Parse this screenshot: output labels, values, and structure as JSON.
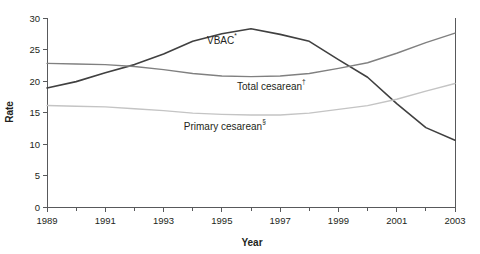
{
  "chart_data": {
    "type": "line",
    "title": "",
    "xlabel": "Year",
    "ylabel": "Rate",
    "xlim": [
      1989,
      2003
    ],
    "ylim": [
      0,
      30
    ],
    "ytick_step": 5,
    "grid": false,
    "legend_position": "inline-annotations",
    "x": [
      1989,
      1990,
      1991,
      1992,
      1993,
      1994,
      1995,
      1996,
      1997,
      1998,
      1999,
      2000,
      2001,
      2002,
      2003
    ],
    "xticks": [
      1989,
      1991,
      1993,
      1995,
      1997,
      1999,
      2001,
      2003
    ],
    "xtick_labels": [
      "1989",
      "1991",
      "1993",
      "1995",
      "1997",
      "1999",
      "2001",
      "2003"
    ],
    "yticks": [
      0,
      5,
      10,
      15,
      20,
      25,
      30
    ],
    "ytick_labels": [
      "0",
      "5",
      "10",
      "15",
      "20",
      "25",
      "30"
    ],
    "series": [
      {
        "name": "VBAC",
        "label_text": "VBAC",
        "label_sup": "*",
        "color": "#404040",
        "width": 1.6,
        "label_x": 1995.0,
        "label_y": 25.9,
        "values": [
          18.9,
          19.9,
          21.3,
          22.6,
          24.3,
          26.3,
          27.5,
          28.3,
          27.4,
          26.3,
          23.4,
          20.6,
          16.4,
          12.6,
          10.6
        ]
      },
      {
        "name": "Total cesarean",
        "label_text": "Total cesarean",
        "label_sup": "†",
        "color": "#808080",
        "width": 1.4,
        "label_x": 1996.7,
        "label_y": 18.6,
        "values": [
          22.8,
          22.7,
          22.6,
          22.3,
          21.8,
          21.2,
          20.8,
          20.7,
          20.8,
          21.2,
          22.0,
          22.9,
          24.4,
          26.1,
          27.6
        ]
      },
      {
        "name": "Primary cesarean",
        "label_text": "Primary cesarean",
        "label_sup": "§",
        "color": "#c4c4c4",
        "width": 1.4,
        "label_x": 1995.1,
        "label_y": 12.3,
        "values": [
          16.1,
          16.0,
          15.9,
          15.6,
          15.3,
          14.9,
          14.7,
          14.6,
          14.6,
          14.9,
          15.5,
          16.1,
          17.1,
          18.4,
          19.6
        ]
      }
    ]
  },
  "axes": {
    "y_title": "Rate",
    "x_title": "Year"
  }
}
